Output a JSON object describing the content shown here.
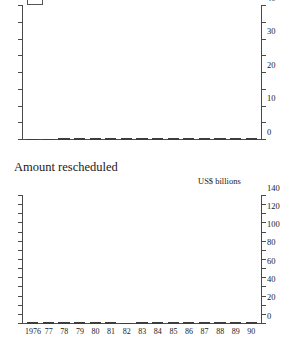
{
  "chart_data": [
    {
      "type": "bar",
      "subtype": "stacked",
      "title": "",
      "xlabel": "",
      "ylabel": "",
      "ylim": [
        0,
        40
      ],
      "yticks": [
        0,
        5,
        10,
        15,
        20,
        25,
        30,
        35,
        40
      ],
      "ytick_labels": [
        "0",
        "",
        "10",
        "",
        "20",
        "",
        "30",
        "",
        "40"
      ],
      "grid": false,
      "legend_position": "top-left-clipped",
      "categories": [
        "1976",
        "77",
        "78",
        "79",
        "80",
        "81",
        "82",
        "83",
        "84",
        "85",
        "86",
        "87",
        "88",
        "89",
        "90"
      ],
      "series": [
        {
          "name": "lower-segment",
          "color": "#ffffff",
          "values": [
            0.0,
            0.0,
            1.5,
            1.0,
            3.0,
            4.0,
            4.0,
            20.0,
            14.5,
            13.5,
            8.0,
            15.0,
            10.5,
            4.0,
            5.0
          ]
        },
        {
          "name": "upper-segment",
          "color": "#6e6e6e",
          "values": [
            1.0,
            3.5,
            1.5,
            3.0,
            3.0,
            9.5,
            9.0,
            14.0,
            11.5,
            17.5,
            15.5,
            16.5,
            15.5,
            24.5,
            11.0
          ]
        }
      ],
      "totals": [
        1.0,
        3.5,
        3.0,
        4.0,
        6.0,
        13.5,
        13.0,
        34.0,
        26.0,
        31.0,
        23.5,
        31.5,
        26.0,
        28.5,
        16.0
      ]
    },
    {
      "type": "bar",
      "subtype": "stacked",
      "title": "Amount rescheduled",
      "xlabel": "",
      "ylabel": "US$ billions",
      "ylim": [
        0,
        140
      ],
      "yticks": [
        0,
        10,
        20,
        30,
        40,
        50,
        60,
        70,
        80,
        90,
        100,
        110,
        120,
        130,
        140
      ],
      "ytick_labels": [
        "0",
        "",
        "20",
        "",
        "40",
        "",
        "60",
        "",
        "80",
        "",
        "100",
        "",
        "120",
        "",
        "140"
      ],
      "grid": false,
      "categories": [
        "1976",
        "77",
        "78",
        "79",
        "80",
        "81",
        "82",
        "83",
        "84",
        "85",
        "86",
        "87",
        "88",
        "89",
        "90"
      ],
      "series": [
        {
          "name": "lower-segment",
          "color": "#ffffff",
          "values": [
            0.3,
            0.3,
            0.8,
            2.5,
            1.2,
            1.5,
            5.0,
            60.0,
            11.0,
            78.0,
            33.0,
            110.0,
            94.0,
            7.0,
            9.0
          ]
        },
        {
          "name": "upper-segment",
          "color": "#6e6e6e",
          "values": [
            0.2,
            0.2,
            0.4,
            2.0,
            0.8,
            1.0,
            0.0,
            4.0,
            2.5,
            3.5,
            12.0,
            27.0,
            9.0,
            17.0,
            13.0
          ]
        }
      ],
      "totals": [
        0.5,
        0.5,
        1.2,
        4.5,
        2.0,
        2.5,
        5.0,
        64.0,
        13.5,
        81.5,
        45.0,
        137.0,
        103.0,
        24.0,
        22.0
      ]
    }
  ],
  "chart1": {
    "unit_label": "",
    "ytick_labels": [
      "40",
      "",
      "30",
      "",
      "20",
      "",
      "10",
      "",
      "0"
    ]
  },
  "chart2": {
    "title": "Amount rescheduled",
    "unit_label": "US$ billions",
    "ytick_labels": [
      "140",
      "",
      "120",
      "",
      "100",
      "",
      "80",
      "",
      "60",
      "",
      "40",
      "",
      "20",
      "",
      "0"
    ]
  }
}
